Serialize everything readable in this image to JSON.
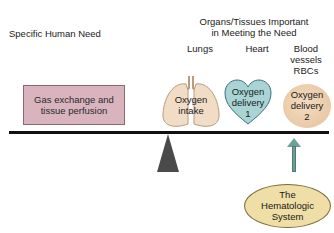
{
  "headers": {
    "need_title": "Specific Human Need",
    "organs_title": "Organs/Tissues Important\nin Meeting the Need"
  },
  "columns": [
    {
      "label": "Lungs"
    },
    {
      "label": "Heart"
    },
    {
      "label": "Blood\nvessels\nRBCs"
    }
  ],
  "need_box": {
    "text": "Gas exchange and\ntissue perfusion",
    "color": "#d9b4bf"
  },
  "organs": [
    {
      "name": "lungs",
      "text": "Oxygen\nintake",
      "color": "#f1dcc6"
    },
    {
      "name": "heart",
      "text": "Oxygen\ndelivery\n1",
      "color": "#a9d4d6"
    },
    {
      "name": "rbc",
      "text": "Oxygen\ndelivery\n2",
      "color": "#ecd0b0"
    }
  ],
  "support": {
    "text": "The\nHematologic\nSystem",
    "color": "#efdea5",
    "arrow_color": "#6e9e98"
  },
  "beam": {
    "color": "#111111"
  },
  "fulcrum": {
    "color": "#4a4a4a"
  }
}
